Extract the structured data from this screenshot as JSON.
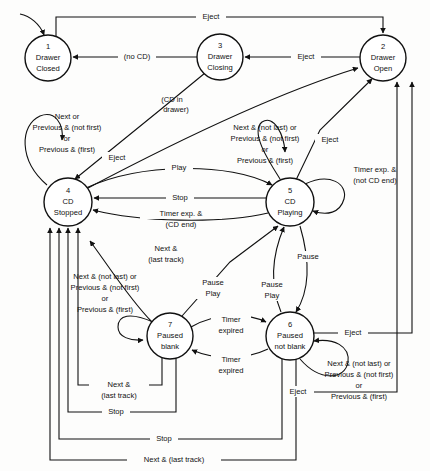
{
  "diagram": {
    "type": "state-machine",
    "stroke_color": "#111111",
    "background_color": "#fdfdfc",
    "states": [
      {
        "id": "1",
        "number": "1",
        "line1": "Drawer",
        "line2": "Closed",
        "cx": 48,
        "cy": 58,
        "r": 23
      },
      {
        "id": "2",
        "number": "2",
        "line1": "Drawer",
        "line2": "Open",
        "cx": 383,
        "cy": 58,
        "r": 23
      },
      {
        "id": "3",
        "number": "3",
        "line1": "Drawer",
        "line2": "Closing",
        "cx": 220,
        "cy": 57,
        "r": 23
      },
      {
        "id": "4",
        "number": "4",
        "line1": "CD",
        "line2": "Stopped",
        "cx": 68,
        "cy": 202,
        "r": 24
      },
      {
        "id": "5",
        "number": "5",
        "line1": "CD",
        "line2": "Playing",
        "cx": 290,
        "cy": 202,
        "r": 24
      },
      {
        "id": "6",
        "number": "6",
        "line1": "Paused",
        "line2": "not blank",
        "cx": 290,
        "cy": 336,
        "r": 24
      },
      {
        "id": "7",
        "number": "7",
        "line1": "Paused",
        "line2": "blank",
        "cx": 170,
        "cy": 336,
        "r": 23
      }
    ],
    "labels": {
      "eject_top": "Eject",
      "no_cd": "(no CD)",
      "eject_3_to_2": "Eject",
      "cd_in_drawer_l1": "(CD in",
      "cd_in_drawer_l2": "drawer)",
      "loop4_l1": "Next or",
      "loop4_l2": "Previous & (not first)",
      "loop4_l3": "or",
      "loop4_l4": "Previous & (first)",
      "eject_4_to_2": "Eject",
      "play": "Play",
      "stop_5_to_4": "Stop",
      "timer_cd_end_l1": "Timer exp. &",
      "timer_cd_end_l2": "(CD end)",
      "loop5_l1": "Next & (not last) or",
      "loop5_l2": "Previous & (not first)",
      "loop5_l3": "or",
      "loop5_l4": "Previous & (first)",
      "eject_5_to_2": "Eject",
      "timer_not_cd_end_l1": "Timer exp. &",
      "timer_not_cd_end_l2": "(not CD end)",
      "next_last_track_l1": "Next &",
      "next_last_track_l2": "(last track)",
      "loop7_l1": "Next & (not last) or",
      "loop7_l2": "Previous & (not first)",
      "loop7_l3": "or",
      "loop7_l4": "Previous & (first)",
      "pause_play_7_l1": "Pause",
      "pause_play_7_l2": "Play",
      "pause_5_to_6": "Pause",
      "pause_play_6_l1": "Pause",
      "pause_play_6_l2": "Play",
      "timer_expired_7_to_6_l1": "Timer",
      "timer_expired_7_to_6_l2": "expired",
      "timer_expired_6_to_7_l1": "Timer",
      "timer_expired_6_to_7_l2": "expired",
      "eject_6_to_2": "Eject",
      "loop6_l1": "Next & (not last) or",
      "loop6_l2": "Previous & (not first)",
      "loop6_l3": "or",
      "loop6_l4": "Previous & (first)",
      "next_last_track_bottom_l1": "Next &",
      "next_last_track_bottom_l2": "(last track)",
      "stop_7_to_4": "Stop",
      "eject_bottom": "Eject",
      "stop_6_to_4": "Stop",
      "next_last_track_bottom_long": "Next & (last track)"
    },
    "transitions": [
      {
        "from": "1",
        "to": "2",
        "label": "Eject"
      },
      {
        "from": "3",
        "to": "1",
        "label": "(no CD)"
      },
      {
        "from": "2",
        "to": "3",
        "label": "Eject"
      },
      {
        "from": "3",
        "to": "4",
        "label": "(CD in drawer)"
      },
      {
        "from": "4",
        "to": "4",
        "label": "Next or Previous & (not first) or Previous & (first)"
      },
      {
        "from": "4",
        "to": "2",
        "label": "Eject"
      },
      {
        "from": "4",
        "to": "5",
        "label": "Play"
      },
      {
        "from": "5",
        "to": "4",
        "label": "Stop"
      },
      {
        "from": "5",
        "to": "4",
        "label": "Timer exp. & (CD end)"
      },
      {
        "from": "5",
        "to": "5",
        "label": "Next & (not last) or Previous & (not first) or Previous & (first)"
      },
      {
        "from": "5",
        "to": "2",
        "label": "Eject"
      },
      {
        "from": "5",
        "to": "5",
        "label": "Timer exp. & (not CD end)"
      },
      {
        "from": "7",
        "to": "4",
        "label": "Next & (last track)"
      },
      {
        "from": "7",
        "to": "7",
        "label": "Next & (not last) or Previous & (not first) or Previous & (first)"
      },
      {
        "from": "7",
        "to": "5",
        "label": "Pause Play"
      },
      {
        "from": "5",
        "to": "6",
        "label": "Pause"
      },
      {
        "from": "6",
        "to": "5",
        "label": "Pause Play"
      },
      {
        "from": "7",
        "to": "6",
        "label": "Timer expired"
      },
      {
        "from": "6",
        "to": "7",
        "label": "Timer expired"
      },
      {
        "from": "6",
        "to": "2",
        "label": "Eject"
      },
      {
        "from": "6",
        "to": "6",
        "label": "Next & (not last) or Previous & (not first) or Previous & (first)"
      },
      {
        "from": "7",
        "to": "4",
        "label": "Stop"
      },
      {
        "from": "6",
        "to": "4",
        "label": "Stop"
      },
      {
        "from": "6",
        "to": "4",
        "label": "Next & (last track)"
      }
    ]
  }
}
